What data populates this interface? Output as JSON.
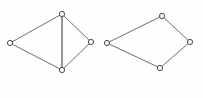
{
  "figure": {
    "background_color": "#fefefe",
    "edge_color": "#6e6e72",
    "vertex_fill_color": "#ffffff",
    "vertex_stroke_color": "#4a4a4e",
    "vertex_radius": 2.6,
    "graphs": [
      {
        "name": "left-graph",
        "label": "",
        "description": "Quadrilateral with vertical diagonal",
        "vertices": [
          {
            "id": "L-top",
            "name": "vertex-top",
            "x": 62,
            "y": 14
          },
          {
            "id": "L-left",
            "name": "vertex-left",
            "x": 10,
            "y": 43
          },
          {
            "id": "L-right",
            "name": "vertex-right",
            "x": 91,
            "y": 42
          },
          {
            "id": "L-bottom",
            "name": "vertex-bottom",
            "x": 62,
            "y": 70
          }
        ],
        "edges": [
          {
            "from": "L-top",
            "to": "L-left",
            "style": "plain"
          },
          {
            "from": "L-top",
            "to": "L-right",
            "style": "plain"
          },
          {
            "from": "L-left",
            "to": "L-bottom",
            "style": "plain"
          },
          {
            "from": "L-right",
            "to": "L-bottom",
            "style": "plain"
          },
          {
            "from": "L-top",
            "to": "L-bottom",
            "style": "diagonal"
          }
        ]
      },
      {
        "name": "right-graph",
        "label": "",
        "description": "Quadrilateral four-cycle",
        "vertices": [
          {
            "id": "R-top",
            "name": "vertex-top",
            "x": 162,
            "y": 16
          },
          {
            "id": "R-left",
            "name": "vertex-left",
            "x": 107,
            "y": 43
          },
          {
            "id": "R-right",
            "name": "vertex-right",
            "x": 190,
            "y": 42
          },
          {
            "id": "R-bottom",
            "name": "vertex-bottom",
            "x": 160,
            "y": 68
          }
        ],
        "edges": [
          {
            "from": "R-top",
            "to": "R-left",
            "style": "plain"
          },
          {
            "from": "R-top",
            "to": "R-right",
            "style": "plain"
          },
          {
            "from": "R-left",
            "to": "R-bottom",
            "style": "plain"
          },
          {
            "from": "R-right",
            "to": "R-bottom",
            "style": "plain"
          }
        ]
      }
    ]
  }
}
